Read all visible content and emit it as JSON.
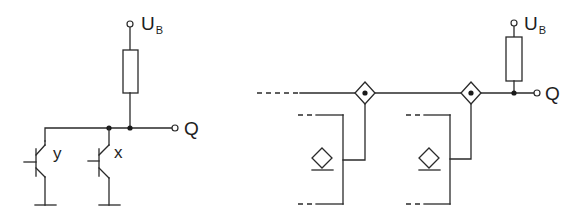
{
  "diagram": {
    "type": "circuit-schematic",
    "colors": {
      "line": "#2a2a2a",
      "background": "#ffffff"
    },
    "left_circuit": {
      "name": "wired-or-open-collector",
      "supply_label": {
        "main": "U",
        "sub": "B"
      },
      "output_label": "Q",
      "transistors": [
        {
          "label": "y"
        },
        {
          "label": "x"
        }
      ]
    },
    "right_circuit": {
      "name": "cascaded-switch-chain",
      "supply_label": {
        "main": "U",
        "sub": "B"
      },
      "output_label": "Q",
      "stages": 2
    }
  }
}
